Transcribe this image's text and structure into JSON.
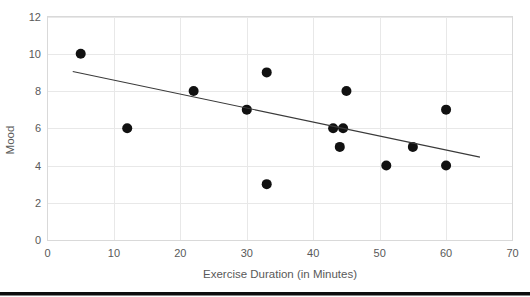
{
  "chart_data": {
    "type": "scatter",
    "title": "",
    "xlabel": "Exercise Duration (in Minutes)",
    "ylabel": "Mood",
    "xlim": [
      0,
      70
    ],
    "ylim": [
      0,
      12
    ],
    "xticks": [
      0,
      10,
      20,
      30,
      40,
      50,
      60,
      70
    ],
    "yticks": [
      0,
      2,
      4,
      6,
      8,
      10,
      12
    ],
    "xtick_labels": [
      "0",
      "10",
      "20",
      "30",
      "40",
      "50",
      "60",
      "70"
    ],
    "ytick_labels": [
      "0",
      "2",
      "4",
      "6",
      "8",
      "10",
      "12"
    ],
    "grid": "horizontal-and-vertical",
    "legend": "none",
    "marker_color": "#111111",
    "marker_size": 5,
    "gridline_color": "#e8e8e8",
    "tick_label_color": "#595959",
    "points": [
      {
        "x": 5,
        "y": 10
      },
      {
        "x": 12,
        "y": 6
      },
      {
        "x": 22,
        "y": 8
      },
      {
        "x": 30,
        "y": 7
      },
      {
        "x": 33,
        "y": 9
      },
      {
        "x": 33,
        "y": 3
      },
      {
        "x": 43,
        "y": 6
      },
      {
        "x": 44.5,
        "y": 6
      },
      {
        "x": 44,
        "y": 5
      },
      {
        "x": 45,
        "y": 8
      },
      {
        "x": 51,
        "y": 4
      },
      {
        "x": 55,
        "y": 5
      },
      {
        "x": 60,
        "y": 7
      },
      {
        "x": 60,
        "y": 4
      }
    ],
    "trendline": {
      "type": "linear",
      "color": "#3a3a3a",
      "x_start": 3.8,
      "y_start": 9.05,
      "x_end": 65.1,
      "y_end": 4.45
    }
  }
}
